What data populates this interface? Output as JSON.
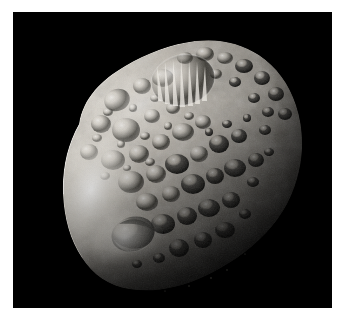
{
  "image": {
    "subject": "Hyperion",
    "subject_kind": "moon",
    "scene": "A heavily cratered, irregularly shaped icy moon lit from the upper left against the black of space",
    "caption": "",
    "background_color": "#000000",
    "border_color": "#ffffff",
    "border_width_px": 13,
    "canvas": {
      "x": 13,
      "y": 12,
      "width": 319,
      "height": 296
    }
  },
  "lighting": {
    "source_direction": "upper-left",
    "terminator_side": "right",
    "highlight_color": "#f2efe9",
    "midtone_color": "#9b968d",
    "shadow_color": "#1a1916",
    "limb_glow_color": "#fbfaf6"
  },
  "body": {
    "name": "Hyperion",
    "outline_description": "lumpy ovoid tilted about -30 degrees, widest from lower-left to upper-right",
    "center": {
      "x": 170,
      "y": 150
    },
    "radius_x": 128,
    "radius_y": 112,
    "rotation_deg": -28,
    "surface_color_light": "#ded9d0",
    "surface_color_mid": "#8e897f",
    "surface_color_dark": "#2b2a26"
  },
  "features": [
    {
      "name": "bright-limb-left",
      "type": "limb-highlight",
      "x": 62,
      "y": 175,
      "size": 70,
      "tone": "bright"
    },
    {
      "name": "rayed-crater-north",
      "type": "crater",
      "x": 168,
      "y": 62,
      "size": 52,
      "tone": "bright-rays"
    },
    {
      "name": "large-shadowed-crater-south",
      "type": "crater",
      "x": 118,
      "y": 218,
      "size": 34,
      "tone": "dark-floor"
    },
    {
      "name": "terminator-shadow-east",
      "type": "shadow",
      "x": 255,
      "y": 160,
      "size": 120,
      "tone": "dark"
    },
    {
      "name": "sponge-texture-field",
      "type": "crater-field",
      "x": 150,
      "y": 140,
      "size": 220,
      "tone": "mixed"
    }
  ],
  "accessibility": {
    "alt_text": "Close-up photograph of Saturn's moon Hyperion showing a deeply pitted, sponge-like surface covered in sharp-rimmed craters, brightly illuminated from the upper left and fading into shadow on the right, against black space."
  }
}
